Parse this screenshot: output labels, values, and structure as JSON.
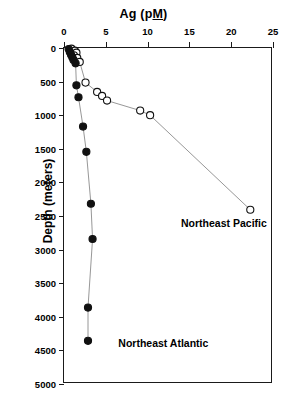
{
  "chart_data": {
    "type": "line",
    "title": "Ag (pM)",
    "title_parts": {
      "before": "Ag (p",
      "underlined": "M",
      "after": ")"
    },
    "xlabel": "Ag (pM)",
    "ylabel": "Depth (meters)",
    "xlim": [
      0,
      25
    ],
    "ylim": [
      0,
      5000
    ],
    "y_inverted": true,
    "x_axis_position": "top",
    "grid": false,
    "legend_position": "in-plot-annotations",
    "xticks": [
      0,
      5,
      10,
      15,
      20,
      25
    ],
    "yticks": [
      0,
      500,
      1000,
      1500,
      2000,
      2500,
      3000,
      3500,
      4000,
      4500,
      5000
    ],
    "series": [
      {
        "name": "Northeast Pacific",
        "marker": "open-circle",
        "marker_color": "#ffffff",
        "marker_edge_color": "#111111",
        "line_color": "#8a8a8a",
        "x": [
          0.9,
          1.3,
          1.5,
          1.2,
          1.6,
          1.9,
          2.6,
          4.0,
          4.6,
          5.2,
          9.2,
          10.4,
          22.5
        ],
        "y": [
          10,
          40,
          70,
          110,
          150,
          210,
          520,
          660,
          720,
          790,
          940,
          1010,
          2430
        ],
        "label_x": 14.0,
        "label_y": 2620
      },
      {
        "name": "Northeast Atlantic",
        "marker": "filled-circle",
        "marker_color": "#111111",
        "marker_edge_color": "#111111",
        "line_color": "#8a8a8a",
        "x": [
          0.55,
          0.7,
          0.85,
          1.0,
          1.15,
          1.4,
          1.5,
          1.75,
          2.3,
          2.7,
          3.25,
          3.45,
          2.9
        ],
        "y": [
          15,
          60,
          100,
          140,
          180,
          230,
          560,
          740,
          1180,
          1560,
          2340,
          2870,
          3900
        ],
        "label_x": 6.2,
        "label_y": 4400
      }
    ],
    "extra_points": [
      {
        "series": "Northeast Atlantic",
        "x": 2.9,
        "y": 4400,
        "marker": "filled-circle"
      }
    ],
    "annotations": [
      {
        "text": "Northeast Pacific",
        "x": 14.0,
        "y": 2620
      },
      {
        "text": "Northeast Atlantic",
        "x": 6.5,
        "y": 4400
      }
    ]
  }
}
